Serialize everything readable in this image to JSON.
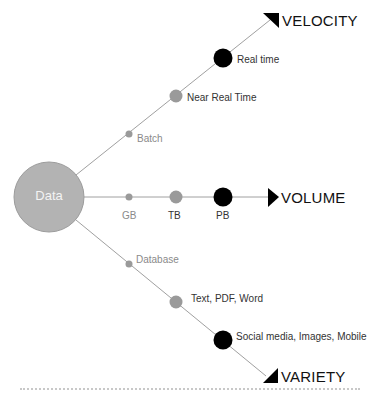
{
  "diagram": {
    "center": {
      "label": "Data",
      "color": "#b3b3b3"
    },
    "axes": [
      {
        "name": "VELOCITY",
        "points": [
          {
            "label": "Batch",
            "size": "small",
            "color": "#9a9a9a"
          },
          {
            "label": "Near Real Time",
            "size": "medium",
            "color": "#9a9a9a"
          },
          {
            "label": "Real time",
            "size": "large",
            "color": "#000000"
          }
        ]
      },
      {
        "name": "VOLUME",
        "points": [
          {
            "label": "GB",
            "size": "small",
            "color": "#9a9a9a"
          },
          {
            "label": "TB",
            "size": "medium",
            "color": "#9a9a9a"
          },
          {
            "label": "PB",
            "size": "large",
            "color": "#000000"
          }
        ]
      },
      {
        "name": "VARIETY",
        "points": [
          {
            "label": "Database",
            "size": "small",
            "color": "#9a9a9a"
          },
          {
            "label": "Text, PDF, Word",
            "size": "medium",
            "color": "#9a9a9a"
          },
          {
            "label": "Social media, Images, Mobile",
            "size": "large",
            "color": "#000000"
          }
        ]
      }
    ],
    "line_color": "#9a9a9a",
    "arrow_color": "#000000"
  }
}
